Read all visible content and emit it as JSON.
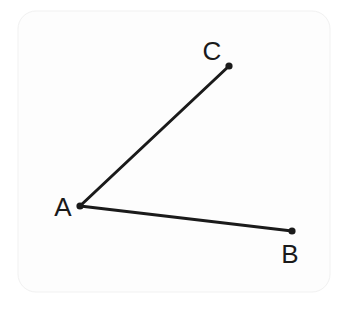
{
  "figure": {
    "canvas": {
      "width": 349,
      "height": 309,
      "background_color": "#ffffff"
    },
    "card": {
      "x": 18,
      "y": 11,
      "width": 312,
      "height": 281,
      "corner_radius": 18,
      "fill_color": "#fdfdfd",
      "border_color": "#f1f1f1"
    },
    "style": {
      "stroke_color": "#1a1a1a",
      "stroke_width": 3,
      "dot_radius": 3.6,
      "dot_color": "#1a1a1a",
      "label_color": "#1a1a1a",
      "label_font_size": 26
    },
    "points": [
      {
        "id": "A",
        "label": "A",
        "role": "vertex",
        "x": 80,
        "y": 206,
        "label_x": 63,
        "label_y": 216
      },
      {
        "id": "B",
        "label": "B",
        "role": "endpoint",
        "x": 292,
        "y": 231,
        "label_x": 290,
        "label_y": 263
      },
      {
        "id": "C",
        "label": "C",
        "role": "endpoint",
        "x": 229,
        "y": 66,
        "label_x": 212,
        "label_y": 60
      }
    ],
    "segments": [
      {
        "id": "AC",
        "from": "A",
        "to": "C",
        "x1": 80,
        "y1": 206,
        "x2": 229,
        "y2": 66
      },
      {
        "id": "AB",
        "from": "A",
        "to": "B",
        "x1": 80,
        "y1": 206,
        "x2": 292,
        "y2": 231
      }
    ]
  }
}
